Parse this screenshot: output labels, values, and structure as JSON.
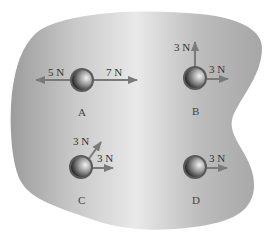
{
  "diagram": {
    "colors": {
      "surface_light": "#e6e6e6",
      "surface_dark": "#a9a9a9",
      "arrow": "#7a7a7a",
      "puck_dark": "#2e2e2e",
      "puck_light": "#e8e8e8",
      "text": "#333333"
    },
    "pucks": [
      {
        "id": "A",
        "label": "A",
        "forces": [
          {
            "label": "5 N",
            "direction": "left"
          },
          {
            "label": "7 N",
            "direction": "right"
          }
        ]
      },
      {
        "id": "B",
        "label": "B",
        "forces": [
          {
            "label": "3 N",
            "direction": "up"
          },
          {
            "label": "3 N",
            "direction": "right"
          }
        ]
      },
      {
        "id": "C",
        "label": "C",
        "forces": [
          {
            "label": "3 N",
            "direction": "up-right (diagonal)"
          },
          {
            "label": "3 N",
            "direction": "right"
          }
        ]
      },
      {
        "id": "D",
        "label": "D",
        "forces": [
          {
            "label": "3 N",
            "direction": "right"
          }
        ]
      }
    ]
  }
}
